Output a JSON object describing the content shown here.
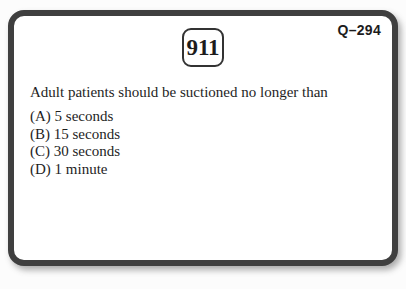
{
  "card": {
    "code": "Q–294",
    "question_number": "911",
    "question": "Adult patients should be suctioned no longer than",
    "options": [
      "(A) 5 seconds",
      "(B) 15 seconds",
      "(C) 30 seconds",
      "(D) 1 minute"
    ]
  }
}
